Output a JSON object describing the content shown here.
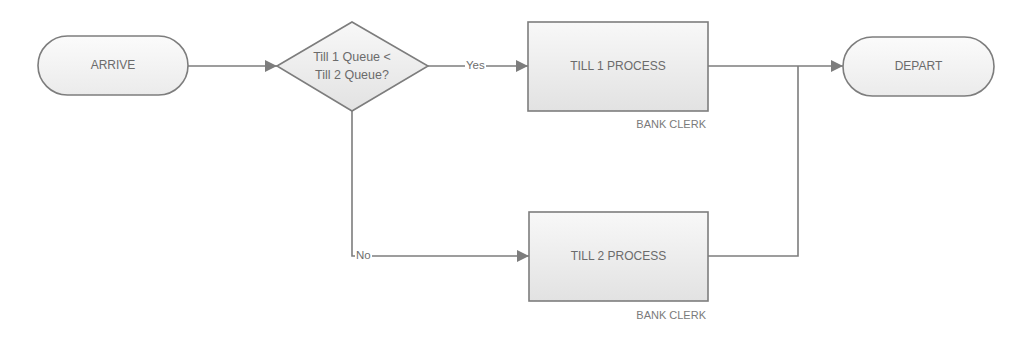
{
  "diagram": {
    "type": "flowchart",
    "colors": {
      "stroke": "#7d7d7d",
      "fill_top": "#f7f7f7",
      "fill_bottom": "#e4e4e4",
      "text": "#6b6b6b",
      "background": "#ffffff"
    },
    "nodes": {
      "arrive": {
        "shape": "terminator",
        "label": "ARRIVE"
      },
      "decision": {
        "shape": "decision",
        "label_line1": "Till 1 Queue <",
        "label_line2": "Till 2 Queue?"
      },
      "till1": {
        "shape": "process",
        "label": "TILL 1 PROCESS",
        "resource": "BANK CLERK"
      },
      "till2": {
        "shape": "process",
        "label": "TILL 2 PROCESS",
        "resource": "BANK CLERK"
      },
      "depart": {
        "shape": "terminator",
        "label": "DEPART"
      }
    },
    "edges": [
      {
        "from": "ARRIVE",
        "to": "Till 1 Queue < Till 2 Queue?",
        "label": ""
      },
      {
        "from": "Till 1 Queue < Till 2 Queue?",
        "to": "TILL 1 PROCESS",
        "label": "Yes"
      },
      {
        "from": "Till 1 Queue < Till 2 Queue?",
        "to": "TILL 2 PROCESS",
        "label": "No"
      },
      {
        "from": "TILL 1 PROCESS",
        "to": "DEPART",
        "label": ""
      },
      {
        "from": "TILL 2 PROCESS",
        "to": "DEPART",
        "label": ""
      }
    ],
    "edge_labels": {
      "yes": "Yes",
      "no": "No"
    }
  }
}
